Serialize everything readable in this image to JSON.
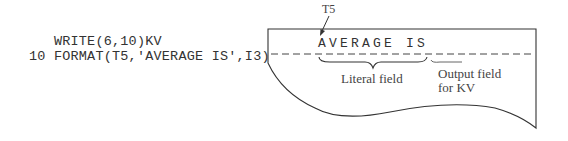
{
  "code": {
    "line1": "   WRITE(6,10)KV",
    "line2": "10 FORMAT(T5,'AVERAGE IS',I3)"
  },
  "printout": {
    "tab_label": "T5",
    "literal_text": "AVERAGE IS",
    "literal_label": "Literal field",
    "output_label_line1": "Output field",
    "output_label_line2": "for KV"
  }
}
